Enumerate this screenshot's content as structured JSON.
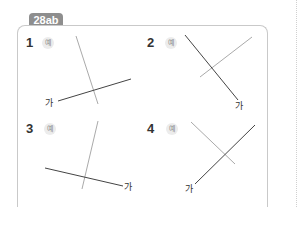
{
  "tab": {
    "label": "28ab"
  },
  "problems": [
    {
      "number": "1",
      "example_label": "예",
      "line_label": "가"
    },
    {
      "number": "2",
      "example_label": "예",
      "line_label": "가"
    },
    {
      "number": "3",
      "example_label": "예",
      "line_label": "가"
    },
    {
      "number": "4",
      "example_label": "예",
      "line_label": "가"
    }
  ],
  "colors": {
    "tab": "#8e8e8e",
    "dark_line": "#444444",
    "light_line": "#aaaaaa",
    "border": "#c9c9c9"
  }
}
